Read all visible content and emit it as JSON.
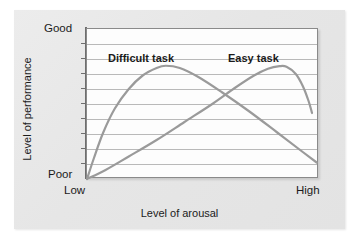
{
  "figure": {
    "background_color": "#ffffff",
    "card_color": "#e9e9e9",
    "plot_background": "#fdfdfd",
    "curve_color": "#9a9a9a",
    "gridline_color": "#b9b9b9",
    "axis_color": "#6e6e6e",
    "text_color": "#1b1b1b"
  },
  "labels": {
    "y_axis_title": "Level of performance",
    "x_axis_title": "Level of arousal",
    "y_top": "Good",
    "y_bottom": "Poor",
    "x_left": "Low",
    "x_right": "High",
    "series_difficult": "Difficult task",
    "series_easy": "Easy task"
  },
  "chart_data": {
    "type": "line",
    "title": "",
    "xlabel": "Level of arousal",
    "ylabel": "Level of performance",
    "xlim": [
      0,
      1
    ],
    "ylim": [
      0,
      1
    ],
    "x_tick_labels": [
      "Low",
      "High"
    ],
    "y_tick_labels": [
      "Poor",
      "Good"
    ],
    "grid": true,
    "gridlines_horizontal": 10,
    "legend": "inline-annotations",
    "series": [
      {
        "name": "Difficult task",
        "label_position": {
          "x": 0.14,
          "y": 0.85
        },
        "points": [
          {
            "x": 0.0,
            "y": 0.0
          },
          {
            "x": 0.03,
            "y": 0.14
          },
          {
            "x": 0.07,
            "y": 0.31
          },
          {
            "x": 0.12,
            "y": 0.47
          },
          {
            "x": 0.18,
            "y": 0.6
          },
          {
            "x": 0.24,
            "y": 0.69
          },
          {
            "x": 0.3,
            "y": 0.74
          },
          {
            "x": 0.34,
            "y": 0.755
          },
          {
            "x": 0.4,
            "y": 0.74
          },
          {
            "x": 0.48,
            "y": 0.68
          },
          {
            "x": 0.58,
            "y": 0.58
          },
          {
            "x": 0.7,
            "y": 0.45
          },
          {
            "x": 0.82,
            "y": 0.31
          },
          {
            "x": 0.93,
            "y": 0.18
          },
          {
            "x": 0.99,
            "y": 0.11
          }
        ]
      },
      {
        "name": "Easy task",
        "label_position": {
          "x": 0.63,
          "y": 0.85
        },
        "points": [
          {
            "x": 0.0,
            "y": 0.0
          },
          {
            "x": 0.08,
            "y": 0.06
          },
          {
            "x": 0.18,
            "y": 0.15
          },
          {
            "x": 0.3,
            "y": 0.26
          },
          {
            "x": 0.42,
            "y": 0.38
          },
          {
            "x": 0.54,
            "y": 0.5
          },
          {
            "x": 0.64,
            "y": 0.61
          },
          {
            "x": 0.72,
            "y": 0.69
          },
          {
            "x": 0.78,
            "y": 0.735
          },
          {
            "x": 0.83,
            "y": 0.752
          },
          {
            "x": 0.86,
            "y": 0.748
          },
          {
            "x": 0.9,
            "y": 0.7
          },
          {
            "x": 0.93,
            "y": 0.62
          },
          {
            "x": 0.955,
            "y": 0.52
          },
          {
            "x": 0.97,
            "y": 0.44
          }
        ]
      }
    ]
  }
}
